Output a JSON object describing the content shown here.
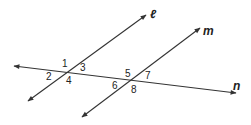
{
  "diagram": {
    "type": "parallel-lines-cut-by-transversal",
    "lines": [
      {
        "name": "ell",
        "label": "ℓ",
        "x1": 28,
        "y1": 101,
        "x2": 146,
        "y2": 15,
        "label_x": 150,
        "label_y": 18
      },
      {
        "name": "m",
        "label": "m",
        "x1": 82,
        "y1": 117,
        "x2": 200,
        "y2": 28,
        "label_x": 203,
        "label_y": 35
      },
      {
        "name": "n",
        "label": "n",
        "x1": 14,
        "y1": 66,
        "x2": 236,
        "y2": 93,
        "label_x": 233,
        "label_y": 90
      }
    ],
    "angles": [
      {
        "label": "1",
        "x": 62,
        "y": 67
      },
      {
        "label": "3",
        "x": 80,
        "y": 71
      },
      {
        "label": "2",
        "x": 46,
        "y": 80
      },
      {
        "label": "4",
        "x": 66,
        "y": 84
      },
      {
        "label": "5",
        "x": 125,
        "y": 77
      },
      {
        "label": "7",
        "x": 145,
        "y": 79
      },
      {
        "label": "6",
        "x": 112,
        "y": 89
      },
      {
        "label": "8",
        "x": 131,
        "y": 93
      }
    ],
    "color": "#333333"
  }
}
